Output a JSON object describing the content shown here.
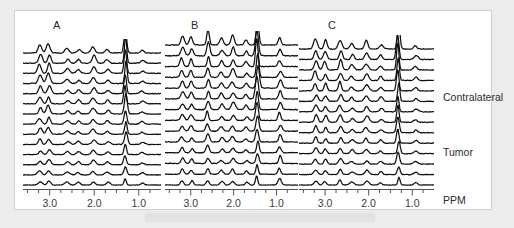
{
  "figure": {
    "background_color": "#ececec",
    "panel_background": "#ffffff",
    "panel_border_color": "#cfcfcf",
    "trace_color": "#101010",
    "axis_color": "#555555",
    "caption_bar_color": "#e2e2e2"
  },
  "panels": [
    {
      "label": "A",
      "label_x": 52,
      "label_y": 18
    },
    {
      "label": "B",
      "label_x": 190,
      "label_y": 18
    },
    {
      "label": "C",
      "label_x": 327,
      "label_y": 18
    }
  ],
  "axis": {
    "tick_labels": [
      "3.0",
      "2.0",
      "1.0"
    ],
    "unit_label": "PPM",
    "direction": "decreasing"
  },
  "annotations": [
    {
      "text": "Contralateral",
      "x": 428,
      "y": 91
    },
    {
      "text": "Tumor",
      "x": 428,
      "y": 146
    }
  ],
  "chart_data": {
    "type": "line",
    "title": "",
    "xlabel": "PPM",
    "ylabel": "",
    "xlim": [
      3.6,
      0.5
    ],
    "grid": false,
    "legend": "none",
    "xticks": [
      3.0,
      2.0,
      1.0
    ],
    "n_traces_per_panel": 14,
    "series": [
      {
        "name": "A",
        "peaks": [
          {
            "ppm": 3.22,
            "label": "",
            "rel_height": 0.55
          },
          {
            "ppm": 3.02,
            "label": "",
            "rel_height": 0.62
          },
          {
            "ppm": 2.02,
            "label": "",
            "rel_height": 0.48
          },
          {
            "ppm": 1.3,
            "label": "",
            "rel_height": 1.0
          }
        ]
      },
      {
        "name": "B",
        "peaks": [
          {
            "ppm": 3.2,
            "label": "",
            "rel_height": 0.5
          },
          {
            "ppm": 2.6,
            "label": "",
            "rel_height": 0.7
          },
          {
            "ppm": 2.02,
            "label": "",
            "rel_height": 0.52
          },
          {
            "ppm": 1.45,
            "label": "",
            "rel_height": 1.0
          },
          {
            "ppm": 0.92,
            "label": "",
            "rel_height": 0.4
          }
        ]
      },
      {
        "name": "C",
        "peaks": [
          {
            "ppm": 3.22,
            "label": "",
            "rel_height": 0.58
          },
          {
            "ppm": 2.65,
            "label": "",
            "rel_height": 0.6
          },
          {
            "ppm": 2.05,
            "label": "",
            "rel_height": 0.45
          },
          {
            "ppm": 1.32,
            "label": "",
            "rel_height": 1.0
          }
        ]
      }
    ]
  }
}
